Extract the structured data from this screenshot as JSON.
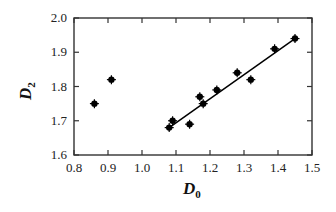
{
  "chart_data": {
    "type": "scatter",
    "title": "",
    "xlabel": "D0",
    "ylabel": "D2",
    "xlabel_parts": {
      "main": "D",
      "sub": "0"
    },
    "ylabel_parts": {
      "main": "D",
      "sub": "2"
    },
    "xlim": [
      0.8,
      1.5
    ],
    "ylim": [
      1.6,
      2.0
    ],
    "x_ticks": [
      "0.8",
      "0.9",
      "1.0",
      "1.1",
      "1.2",
      "1.3",
      "1.4",
      "1.5"
    ],
    "y_ticks": [
      "1.6",
      "1.7",
      "1.8",
      "1.9",
      "2.0"
    ],
    "grid": false,
    "legend": null,
    "series": [
      {
        "name": "data",
        "marker": "filled-circle-with-errorbars",
        "color": "#000000",
        "points": [
          {
            "x": 0.86,
            "y": 1.75
          },
          {
            "x": 0.91,
            "y": 1.82
          },
          {
            "x": 1.08,
            "y": 1.68
          },
          {
            "x": 1.09,
            "y": 1.7
          },
          {
            "x": 1.14,
            "y": 1.69
          },
          {
            "x": 1.17,
            "y": 1.77
          },
          {
            "x": 1.18,
            "y": 1.75
          },
          {
            "x": 1.22,
            "y": 1.79
          },
          {
            "x": 1.28,
            "y": 1.84
          },
          {
            "x": 1.32,
            "y": 1.82
          },
          {
            "x": 1.39,
            "y": 1.91
          },
          {
            "x": 1.45,
            "y": 1.94
          }
        ]
      },
      {
        "name": "linear fit",
        "type": "line",
        "color": "#000000",
        "points": [
          {
            "x": 1.08,
            "y": 1.68
          },
          {
            "x": 1.45,
            "y": 1.94
          }
        ]
      }
    ]
  }
}
